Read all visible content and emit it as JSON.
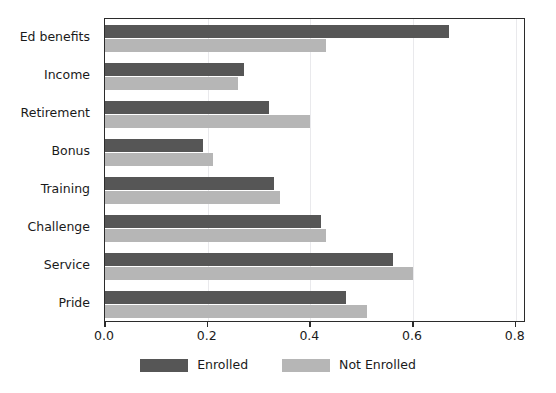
{
  "chart_data": {
    "type": "bar",
    "orientation": "horizontal",
    "title": "",
    "xlabel": "",
    "ylabel": "",
    "xlim": [
      0.0,
      0.82
    ],
    "xticks": [
      0.0,
      0.2,
      0.4,
      0.6,
      0.8
    ],
    "xtick_labels": [
      "0.0",
      "0.2",
      "0.4",
      "0.6",
      "0.8"
    ],
    "categories": [
      "Ed benefits",
      "Income",
      "Retirement",
      "Bonus",
      "Training",
      "Challenge",
      "Service",
      "Pride"
    ],
    "series": [
      {
        "name": "Enrolled",
        "color": "#565656",
        "values": [
          0.67,
          0.27,
          0.32,
          0.19,
          0.33,
          0.42,
          0.56,
          0.47
        ]
      },
      {
        "name": "Not Enrolled",
        "color": "#b6b6b6",
        "values": [
          0.43,
          0.26,
          0.4,
          0.21,
          0.34,
          0.43,
          0.6,
          0.51
        ]
      }
    ],
    "grid": true,
    "grid_axis": "x",
    "legend_position": "bottom-center"
  },
  "legend": {
    "entries": [
      {
        "label": "Enrolled",
        "swatch": "enrolled"
      },
      {
        "label": "Not Enrolled",
        "swatch": "not-enrolled"
      }
    ]
  },
  "colors": {
    "enrolled": "#565656",
    "not_enrolled": "#b6b6b6",
    "axis": "#2b2b2b",
    "grid": "#e9e9ec",
    "background": "#ffffff"
  }
}
